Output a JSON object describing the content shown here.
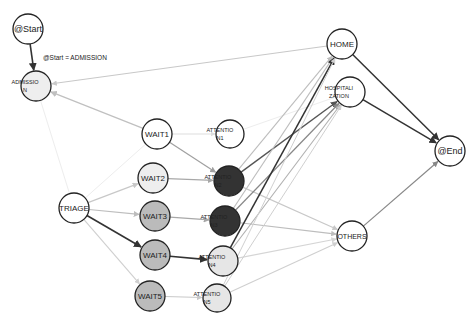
{
  "diagram": {
    "type": "process-flow-graph",
    "edge_label": {
      "text": "@Start = ADMISSION",
      "x": 43,
      "y": 60
    },
    "nodes": [
      {
        "id": "start",
        "lines": [
          "@Start"
        ],
        "x": 28,
        "y": 29,
        "r": 15,
        "fill": "#ffffff",
        "font": 9
      },
      {
        "id": "admission",
        "lines": [
          "ADMISSIO",
          "N"
        ],
        "x": 36,
        "y": 86,
        "r": 15,
        "fill": "#eeeeee",
        "font": 5.5
      },
      {
        "id": "wait1",
        "lines": [
          "WAIT1"
        ],
        "x": 157,
        "y": 134,
        "r": 15,
        "fill": "#ffffff",
        "font": 8
      },
      {
        "id": "attention1",
        "lines": [
          "ATTENTIO",
          "N1"
        ],
        "x": 230,
        "y": 134,
        "r": 14,
        "fill": "#ffffff",
        "font": 5.5
      },
      {
        "id": "wait2",
        "lines": [
          "WAIT2"
        ],
        "x": 153,
        "y": 178,
        "r": 15,
        "fill": "#eeeeee",
        "font": 8
      },
      {
        "id": "attention2",
        "lines": [
          "ATTENTIO",
          "N2"
        ],
        "x": 229,
        "y": 181,
        "r": 15,
        "fill": "#333333",
        "font": 5.5
      },
      {
        "id": "triage",
        "lines": [
          "TRIAGE"
        ],
        "x": 74,
        "y": 208,
        "r": 15,
        "fill": "#ffffff",
        "font": 8
      },
      {
        "id": "wait3",
        "lines": [
          "WAIT3"
        ],
        "x": 155,
        "y": 216,
        "r": 15,
        "fill": "#bbbbbb",
        "font": 8
      },
      {
        "id": "attention3",
        "lines": [
          "ATTENTIO",
          "N3"
        ],
        "x": 225,
        "y": 221,
        "r": 15,
        "fill": "#333333",
        "font": 5.5
      },
      {
        "id": "wait4",
        "lines": [
          "WAIT4"
        ],
        "x": 155,
        "y": 255,
        "r": 15,
        "fill": "#bbbbbb",
        "font": 8
      },
      {
        "id": "attention4",
        "lines": [
          "ATTENTIO",
          "N4"
        ],
        "x": 223,
        "y": 261,
        "r": 15,
        "fill": "#e6e6e6",
        "font": 5.5
      },
      {
        "id": "wait5",
        "lines": [
          "WAIT5"
        ],
        "x": 150,
        "y": 296,
        "r": 15,
        "fill": "#bbbbbb",
        "font": 8
      },
      {
        "id": "attention5",
        "lines": [
          "ATTENTIO",
          "N5"
        ],
        "x": 217,
        "y": 298,
        "r": 14,
        "fill": "#e6e6e6",
        "font": 5.5
      },
      {
        "id": "home",
        "lines": [
          "HOME"
        ],
        "x": 342,
        "y": 44,
        "r": 15,
        "fill": "#ffffff",
        "font": 8
      },
      {
        "id": "hospitalization",
        "lines": [
          "HOSPITALI",
          "ZATION"
        ],
        "x": 350,
        "y": 92,
        "r": 15,
        "fill": "#ffffff",
        "font": 5.5
      },
      {
        "id": "end",
        "lines": [
          "@End"
        ],
        "x": 450,
        "y": 151,
        "r": 15,
        "fill": "#ffffff",
        "font": 9
      },
      {
        "id": "others",
        "lines": [
          "OTHERS"
        ],
        "x": 352,
        "y": 236,
        "r": 15,
        "fill": "#ffffff",
        "font": 7
      }
    ],
    "edges": [
      {
        "from": "start",
        "to": "admission",
        "color": "#333333",
        "w": 1.6
      },
      {
        "from": "home",
        "to": "admission",
        "color": "#c8c8c8",
        "w": 1.1
      },
      {
        "from": "wait1",
        "to": "admission",
        "color": "#c0c0c0",
        "w": 1.3
      },
      {
        "from": "admission",
        "to": "triage",
        "color": "#ededed",
        "w": 1,
        "arrow": false
      },
      {
        "from": "triage",
        "to": "wait1",
        "color": "#ededed",
        "w": 1,
        "arrow": false
      },
      {
        "from": "triage",
        "to": "wait2",
        "color": "#c8c8c8",
        "w": 1.2
      },
      {
        "from": "triage",
        "to": "wait3",
        "color": "#bdbdbd",
        "w": 1.2
      },
      {
        "from": "triage",
        "to": "wait4",
        "color": "#333333",
        "w": 1.6
      },
      {
        "from": "triage",
        "to": "wait5",
        "color": "#cfcfcf",
        "w": 1.1
      },
      {
        "from": "wait1",
        "to": "attention1",
        "color": "#dddddd",
        "w": 1
      },
      {
        "from": "wait1",
        "to": "attention2",
        "color": "#a0a0a0",
        "w": 1.2
      },
      {
        "from": "wait2",
        "to": "attention2",
        "color": "#a8a8a8",
        "w": 1.2
      },
      {
        "from": "wait3",
        "to": "attention3",
        "color": "#a8a8a8",
        "w": 1.2
      },
      {
        "from": "wait4",
        "to": "attention4",
        "color": "#333333",
        "w": 1.6
      },
      {
        "from": "wait5",
        "to": "attention5",
        "color": "#c8c8c8",
        "w": 1.1
      },
      {
        "from": "attention1",
        "to": "hospitalization",
        "color": "#ededed",
        "w": 1,
        "arrow": false
      },
      {
        "from": "attention2",
        "to": "home",
        "color": "#bdbdbd",
        "w": 1.1
      },
      {
        "from": "attention2",
        "to": "hospitalization",
        "color": "#555555",
        "w": 1.4
      },
      {
        "from": "attention2",
        "to": "others",
        "color": "#c8c8c8",
        "w": 1.1
      },
      {
        "from": "attention3",
        "to": "home",
        "color": "#bdbdbd",
        "w": 1.1
      },
      {
        "from": "attention3",
        "to": "hospitalization",
        "color": "#888888",
        "w": 1.2
      },
      {
        "from": "attention3",
        "to": "others",
        "color": "#bdbdbd",
        "w": 1.1
      },
      {
        "from": "attention4",
        "to": "home",
        "color": "#333333",
        "w": 1.5
      },
      {
        "from": "attention4",
        "to": "hospitalization",
        "color": "#b0b0b0",
        "w": 1.1
      },
      {
        "from": "attention4",
        "to": "others",
        "color": "#d5d5d5",
        "w": 1.1
      },
      {
        "from": "attention5",
        "to": "home",
        "color": "#d0d0d0",
        "w": 1
      },
      {
        "from": "attention5",
        "to": "hospitalization",
        "color": "#d0d0d0",
        "w": 1
      },
      {
        "from": "attention5",
        "to": "others",
        "color": "#cfcfcf",
        "w": 1.1
      },
      {
        "from": "home",
        "to": "end",
        "color": "#333333",
        "w": 1.5
      },
      {
        "from": "hospitalization",
        "to": "end",
        "color": "#333333",
        "w": 1.5
      },
      {
        "from": "others",
        "to": "end",
        "color": "#888888",
        "w": 1.2
      }
    ]
  }
}
